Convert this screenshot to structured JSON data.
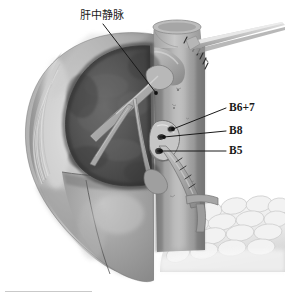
{
  "figure": {
    "width": 285,
    "height": 298,
    "style": "grayscale pencil / airbrush medical illustration",
    "background_color": "#ffffff"
  },
  "labels": [
    {
      "id": "middle-hepatic-vein",
      "text": "肝中静脉",
      "language": "zh",
      "meaning": "middle hepatic vein",
      "x": 80,
      "y": 10,
      "leader": {
        "from_x": 103,
        "from_y": 24,
        "to_x": 156,
        "to_y": 93,
        "dot": true
      }
    },
    {
      "id": "b6-7",
      "text": "B6+7",
      "language": "en",
      "x": 229,
      "y": 102,
      "leader": {
        "from_x": 226,
        "from_y": 108,
        "to_x": 172,
        "to_y": 129,
        "dot": true
      }
    },
    {
      "id": "b8",
      "text": "B8",
      "language": "en",
      "x": 229,
      "y": 125,
      "leader": {
        "from_x": 226,
        "from_y": 131,
        "to_x": 163,
        "to_y": 136,
        "dot": true
      }
    },
    {
      "id": "b5",
      "text": "B5",
      "language": "en",
      "x": 229,
      "y": 145,
      "leader": {
        "from_x": 226,
        "from_y": 151,
        "to_x": 160,
        "to_y": 151,
        "dot": true
      }
    }
  ],
  "anatomy": {
    "liver_capsule": {
      "name": "liver outer capsule",
      "color": "#a8a8a8",
      "highlight_color": "#d8d8d8"
    },
    "cut_surface": {
      "name": "hepatic cut surface (resection plane)",
      "color": "#555555",
      "shadow_color": "#3c3c3c"
    },
    "lower_lobe": {
      "name": "inferior liver lobe",
      "color": "#9a9a9a"
    },
    "middle_hepatic_vein": {
      "name": "middle hepatic vein trunk and branches",
      "color": "#b4b4b4"
    },
    "inferior_vena_cava": {
      "name": "inferior vena cava (vertical column)",
      "color": "#8e8e8e"
    },
    "ivc_cuff": {
      "name": "vena cava cut cuff",
      "color": "#b0b0b0"
    },
    "suture_line": {
      "name": "suture / staple line",
      "color": "#303030"
    },
    "duct_stumps": {
      "name": "transected bile duct stumps",
      "color": "#d0d0d0",
      "lumen_color": "#2e2e2e"
    },
    "portal_branch": {
      "name": "portal / hepatic vessel branch",
      "color": "#9c9c9c"
    },
    "nodular_tissue": {
      "name": "lobulated omental / bowel tissue",
      "color": "#ededed",
      "outline_color": "#c4c4c4"
    },
    "instrument": {
      "name": "retractor / tapering instrument",
      "color": "#c2c2c2"
    }
  },
  "caption_rule": {
    "name": "caption separator rule",
    "x": 5,
    "y": 291,
    "width": 87,
    "color": "#c9c9c9"
  }
}
